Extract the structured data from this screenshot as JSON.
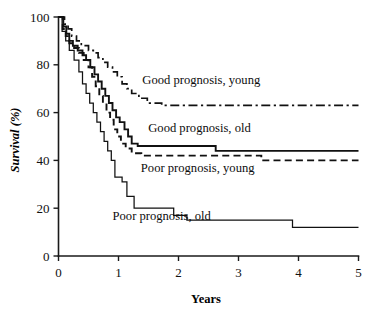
{
  "chart_data": {
    "type": "line",
    "title": "",
    "subtitle": "",
    "xlabel": "Years",
    "ylabel": "Survival (%)",
    "xlim": [
      0,
      5
    ],
    "ylim": [
      0,
      100
    ],
    "xticks": [
      0,
      1,
      2,
      3,
      4,
      5
    ],
    "xtick_labels": [
      "0",
      "1",
      "2",
      "3",
      "4",
      "5"
    ],
    "yticks": [
      0,
      20,
      40,
      60,
      80,
      100
    ],
    "ytick_labels": [
      "0",
      "20",
      "40",
      "60",
      "80",
      "100"
    ],
    "grid": false,
    "legend_position": "inline-annotations",
    "style_note": "Kaplan-Meier step survival curves, monochrome",
    "series": [
      {
        "name": "Good prognosis, young",
        "label": "Good prognosis, young",
        "linestyle": "dashdot",
        "color": "#111111",
        "final_value": 63,
        "label_x": 2.38,
        "label_y": 72,
        "points": [
          [
            0.0,
            100
          ],
          [
            0.1,
            100
          ],
          [
            0.1,
            97
          ],
          [
            0.16,
            97
          ],
          [
            0.16,
            95
          ],
          [
            0.22,
            95
          ],
          [
            0.22,
            92
          ],
          [
            0.3,
            92
          ],
          [
            0.3,
            90
          ],
          [
            0.38,
            90
          ],
          [
            0.38,
            88
          ],
          [
            0.5,
            88
          ],
          [
            0.5,
            86
          ],
          [
            0.58,
            86
          ],
          [
            0.58,
            85
          ],
          [
            0.66,
            85
          ],
          [
            0.66,
            83
          ],
          [
            0.74,
            83
          ],
          [
            0.74,
            81
          ],
          [
            0.82,
            81
          ],
          [
            0.82,
            79
          ],
          [
            0.9,
            79
          ],
          [
            0.9,
            77
          ],
          [
            0.98,
            77
          ],
          [
            0.98,
            75
          ],
          [
            1.06,
            75
          ],
          [
            1.06,
            72
          ],
          [
            1.14,
            72
          ],
          [
            1.14,
            70
          ],
          [
            1.22,
            70
          ],
          [
            1.22,
            68
          ],
          [
            1.34,
            68
          ],
          [
            1.34,
            66
          ],
          [
            1.48,
            66
          ],
          [
            1.48,
            64
          ],
          [
            1.72,
            64
          ],
          [
            1.72,
            63
          ],
          [
            5.0,
            63
          ]
        ]
      },
      {
        "name": "Good prognosis, old",
        "label": "Good prognosis, old",
        "linestyle": "solid-thick",
        "color": "#111111",
        "final_value": 44,
        "label_x": 2.35,
        "label_y": 52,
        "points": [
          [
            0.0,
            100
          ],
          [
            0.08,
            100
          ],
          [
            0.08,
            96
          ],
          [
            0.13,
            96
          ],
          [
            0.13,
            93
          ],
          [
            0.18,
            93
          ],
          [
            0.18,
            90
          ],
          [
            0.24,
            90
          ],
          [
            0.24,
            88
          ],
          [
            0.32,
            88
          ],
          [
            0.32,
            86
          ],
          [
            0.4,
            86
          ],
          [
            0.4,
            84
          ],
          [
            0.46,
            84
          ],
          [
            0.46,
            82
          ],
          [
            0.53,
            82
          ],
          [
            0.53,
            79
          ],
          [
            0.6,
            79
          ],
          [
            0.6,
            76
          ],
          [
            0.66,
            76
          ],
          [
            0.66,
            73
          ],
          [
            0.72,
            73
          ],
          [
            0.72,
            70
          ],
          [
            0.78,
            70
          ],
          [
            0.78,
            67
          ],
          [
            0.84,
            67
          ],
          [
            0.84,
            64
          ],
          [
            0.9,
            64
          ],
          [
            0.9,
            61
          ],
          [
            0.96,
            61
          ],
          [
            0.96,
            58
          ],
          [
            1.02,
            58
          ],
          [
            1.02,
            56
          ],
          [
            1.1,
            56
          ],
          [
            1.1,
            53
          ],
          [
            1.16,
            53
          ],
          [
            1.16,
            50
          ],
          [
            1.22,
            50
          ],
          [
            1.22,
            47
          ],
          [
            1.32,
            47
          ],
          [
            1.32,
            46
          ],
          [
            2.62,
            46
          ],
          [
            2.62,
            44
          ],
          [
            5.0,
            44
          ]
        ]
      },
      {
        "name": "Poor prognosis, young",
        "label": "Poor prognosis, young",
        "linestyle": "dashed",
        "color": "#111111",
        "final_value": 40,
        "label_x": 2.32,
        "label_y": 35,
        "points": [
          [
            0.0,
            100
          ],
          [
            0.07,
            100
          ],
          [
            0.07,
            95
          ],
          [
            0.12,
            95
          ],
          [
            0.12,
            92
          ],
          [
            0.18,
            92
          ],
          [
            0.18,
            89
          ],
          [
            0.26,
            89
          ],
          [
            0.26,
            87
          ],
          [
            0.34,
            87
          ],
          [
            0.34,
            85
          ],
          [
            0.42,
            85
          ],
          [
            0.42,
            82
          ],
          [
            0.5,
            82
          ],
          [
            0.5,
            79
          ],
          [
            0.56,
            79
          ],
          [
            0.56,
            75
          ],
          [
            0.62,
            75
          ],
          [
            0.62,
            71
          ],
          [
            0.68,
            71
          ],
          [
            0.68,
            67
          ],
          [
            0.74,
            67
          ],
          [
            0.74,
            64
          ],
          [
            0.8,
            64
          ],
          [
            0.8,
            60
          ],
          [
            0.86,
            60
          ],
          [
            0.86,
            57
          ],
          [
            0.92,
            57
          ],
          [
            0.92,
            53
          ],
          [
            0.98,
            53
          ],
          [
            0.98,
            50
          ],
          [
            1.04,
            50
          ],
          [
            1.04,
            47
          ],
          [
            1.12,
            47
          ],
          [
            1.12,
            45
          ],
          [
            1.22,
            45
          ],
          [
            1.22,
            43
          ],
          [
            1.38,
            43
          ],
          [
            1.38,
            42
          ],
          [
            3.38,
            42
          ],
          [
            3.38,
            40
          ],
          [
            5.0,
            40
          ]
        ]
      },
      {
        "name": "Poor prognosis, old",
        "label": "Poor prognosis, old",
        "linestyle": "solid-thin",
        "color": "#111111",
        "final_value": 12,
        "label_x": 1.72,
        "label_y": 15,
        "points": [
          [
            0.0,
            100
          ],
          [
            0.06,
            100
          ],
          [
            0.06,
            94
          ],
          [
            0.12,
            94
          ],
          [
            0.12,
            90
          ],
          [
            0.18,
            90
          ],
          [
            0.18,
            86
          ],
          [
            0.26,
            86
          ],
          [
            0.26,
            82
          ],
          [
            0.34,
            82
          ],
          [
            0.34,
            77
          ],
          [
            0.4,
            77
          ],
          [
            0.4,
            72
          ],
          [
            0.46,
            72
          ],
          [
            0.46,
            68
          ],
          [
            0.52,
            68
          ],
          [
            0.52,
            64
          ],
          [
            0.58,
            64
          ],
          [
            0.58,
            60
          ],
          [
            0.64,
            60
          ],
          [
            0.64,
            56
          ],
          [
            0.7,
            56
          ],
          [
            0.7,
            52
          ],
          [
            0.76,
            52
          ],
          [
            0.76,
            48
          ],
          [
            0.82,
            48
          ],
          [
            0.82,
            44
          ],
          [
            0.88,
            44
          ],
          [
            0.88,
            40
          ],
          [
            0.94,
            40
          ],
          [
            0.94,
            33
          ],
          [
            1.06,
            33
          ],
          [
            1.06,
            31
          ],
          [
            1.14,
            31
          ],
          [
            1.14,
            25
          ],
          [
            1.26,
            25
          ],
          [
            1.26,
            20
          ],
          [
            1.92,
            20
          ],
          [
            1.92,
            17
          ],
          [
            2.14,
            17
          ],
          [
            2.14,
            15
          ],
          [
            3.9,
            15
          ],
          [
            3.9,
            12
          ],
          [
            5.0,
            12
          ]
        ]
      }
    ]
  },
  "axis": {
    "x_title": "Years",
    "y_title": "Survival (%)"
  }
}
